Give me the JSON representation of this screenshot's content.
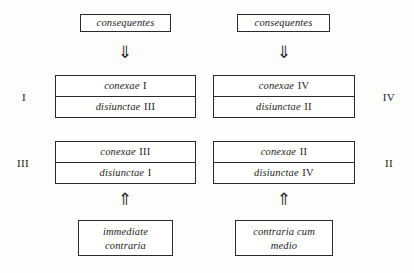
{
  "diagram": {
    "sources": [
      {
        "label": "consequentes",
        "side": "left"
      },
      {
        "label": "consequentes",
        "side": "right"
      }
    ],
    "down_arrows": [
      {
        "glyph": "⇓",
        "name": "double-down-arrow-left"
      },
      {
        "glyph": "⇓",
        "name": "double-down-arrow-right"
      }
    ],
    "up_arrows": [
      {
        "glyph": "⇑",
        "name": "double-up-arrow-left"
      },
      {
        "glyph": "⇑",
        "name": "double-up-arrow-right"
      }
    ],
    "quadrants": [
      {
        "position": "top-left",
        "outer_label": "I",
        "rows": [
          {
            "word": "conexae",
            "numeral": "I"
          },
          {
            "word": "disiunctae",
            "numeral": "III"
          }
        ]
      },
      {
        "position": "top-right",
        "outer_label": "IV",
        "rows": [
          {
            "word": "conexae",
            "numeral": "IV"
          },
          {
            "word": "disiunctae",
            "numeral": "II"
          }
        ]
      },
      {
        "position": "bottom-left",
        "outer_label": "III",
        "rows": [
          {
            "word": "conexae",
            "numeral": "III"
          },
          {
            "word": "disiunctae",
            "numeral": "I"
          }
        ]
      },
      {
        "position": "bottom-right",
        "outer_label": "II",
        "rows": [
          {
            "word": "conexae",
            "numeral": "II"
          },
          {
            "word": "disiunctae",
            "numeral": "IV"
          }
        ]
      }
    ],
    "terms": [
      {
        "line1": "immediate",
        "line2": "contraria",
        "side": "left"
      },
      {
        "line1": "contraria cum",
        "line2": "medio",
        "side": "right"
      }
    ],
    "colors": {
      "ink": "#1b1b1b",
      "rule": "#2a2a2a",
      "paper": "#fdfdfc"
    }
  }
}
